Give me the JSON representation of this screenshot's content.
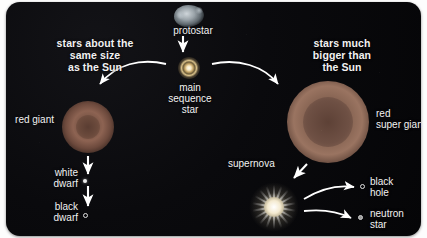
{
  "diagram": {
    "background_color": "#08080a",
    "text_color": "#f2f2f2",
    "branches": {
      "left_header": "stars about the\nsame size\nas the Sun",
      "right_header": "stars much\nbigger than\nthe Sun"
    },
    "stages": [
      {
        "id": "protostar",
        "label": "protostar",
        "marker": "nebula-blob"
      },
      {
        "id": "mainseq",
        "label": "main\nsequence\nstar",
        "marker": "small-star"
      },
      {
        "id": "redgiant",
        "label": "red giant",
        "marker": "red-sphere"
      },
      {
        "id": "whitedwarf",
        "label": "white\ndwarf",
        "marker": "small-white-dot"
      },
      {
        "id": "blackdwarf",
        "label": "black\ndwarf",
        "marker": "hollow-circle"
      },
      {
        "id": "supergiant",
        "label": "red\nsuper giant",
        "marker": "large-red-sphere"
      },
      {
        "id": "supernova",
        "label": "supernova",
        "marker": "bright-star-burst"
      },
      {
        "id": "blackhole",
        "label": "black\nhole",
        "marker": "hollow-circle"
      },
      {
        "id": "neutronstar",
        "label": "neutron\nstar",
        "marker": "small-gray-dot"
      }
    ],
    "arrow_color": "#ffffff"
  }
}
